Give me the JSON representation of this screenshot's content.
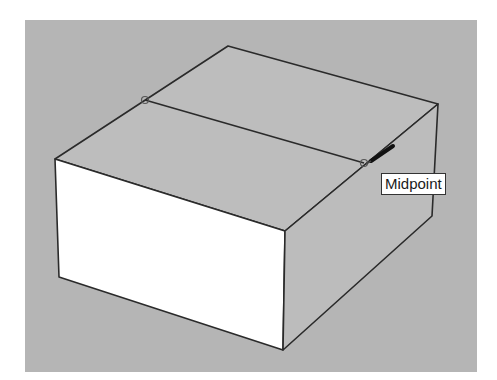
{
  "viewport": {
    "background": "#b5b5b5",
    "model": "box",
    "faces": {
      "top": "#bdbdbd",
      "front_left": "#ffffff",
      "right": "#bcbcbc"
    },
    "edge_color": "#2a2a2a"
  },
  "inference": {
    "tooltip_label": "Midpoint",
    "point_type": "midpoint"
  },
  "tool": {
    "cursor": "pencil-cursor",
    "active_tool": "line"
  }
}
